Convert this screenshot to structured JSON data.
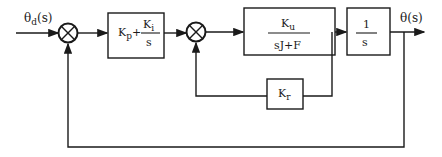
{
  "diagram": {
    "type": "control-block-diagram",
    "input_label": {
      "main": "θ",
      "sub": "d",
      "tail": "(s)"
    },
    "output_label": "θ(s)",
    "blocks": [
      {
        "id": "pi-controller",
        "numerator_prefix": "K",
        "numerator_prefix_sub": "p",
        "plus": "+",
        "frac_num_main": "K",
        "frac_num_sub": "i",
        "frac_den": "s"
      },
      {
        "id": "plant",
        "num_main": "K",
        "num_sub": "u",
        "den": "sJ+F"
      },
      {
        "id": "integrator",
        "num": "1",
        "den": "s"
      },
      {
        "id": "velocity-feedback",
        "main": "K",
        "sub": "r"
      }
    ],
    "summing_junctions": 2,
    "line_color": "#1a1a1a"
  }
}
